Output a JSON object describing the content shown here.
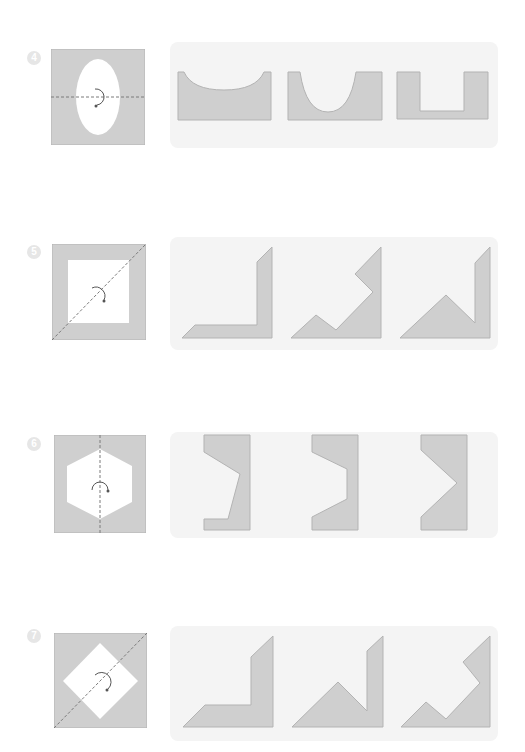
{
  "colors": {
    "shape_fill": "#cfcfcf",
    "shape_stroke": "#b3b3b3",
    "card_bg": "#f4f4f4",
    "badge_bg": "#e6e6e6",
    "fold_line": "#7a7a7a",
    "arrow": "#555555"
  },
  "problems": [
    {
      "number": "4",
      "source_shape": "square with vertical ellipse cut-out, horizontal dashed fold line, rotation arrow",
      "options": [
        "shallow arc cut-out",
        "deep U cut-out",
        "rectangular notch"
      ]
    },
    {
      "number": "5",
      "source_shape": "square frame with square cut-out, diagonal dashed fold line, rotation arrow",
      "options": [
        "L-shape with slanted ends",
        "zigzag shape",
        "triangle with vertical bar"
      ]
    },
    {
      "number": "6",
      "source_shape": "square with hexagon cut-out, vertical dashed fold line, rotation arrow",
      "options": [
        "asymmetric bracket",
        "trapezoid bracket",
        "chevron bracket"
      ]
    },
    {
      "number": "7",
      "source_shape": "square with diamond cut-out, diagonal dashed fold line, rotation arrow",
      "options": [
        "L-shape with slanted ends",
        "triangle with vertical bar",
        "zigzag shape"
      ]
    }
  ]
}
